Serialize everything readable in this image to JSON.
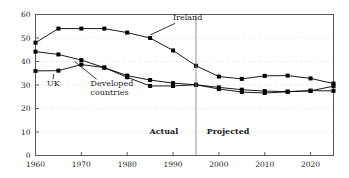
{
  "chart_data": {
    "type": "line",
    "title": "",
    "subtitle": "",
    "xlabel": "",
    "ylabel": "",
    "xlim": [
      1960,
      2025
    ],
    "ylim": [
      0,
      60
    ],
    "grid": true,
    "grid_style": "dotted-horizontal",
    "legend_position": "inline-annotations",
    "x_ticks": [
      1960,
      1970,
      1980,
      1990,
      2000,
      2010,
      2020
    ],
    "x_tick_labels": [
      "1960",
      "1970",
      "1980",
      "1990",
      "2000",
      "2010",
      "2020"
    ],
    "y_ticks": [
      0,
      10,
      20,
      30,
      40,
      50,
      60
    ],
    "y_tick_labels": [
      "0",
      "10",
      "20",
      "30",
      "40",
      "50",
      "60"
    ],
    "x": [
      1960,
      1965,
      1970,
      1975,
      1980,
      1985,
      1990,
      1995,
      2000,
      2005,
      2010,
      2015,
      2020,
      2025
    ],
    "series": [
      {
        "name": "Ireland",
        "marker": "square",
        "color": "#000000",
        "values": [
          48.0,
          54.0,
          54.0,
          54.0,
          52.3,
          50.0,
          44.7,
          38.2,
          33.6,
          32.6,
          33.9,
          34.0,
          32.8,
          30.6
        ]
      },
      {
        "name": "Developed countries",
        "marker": "square",
        "color": "#000000",
        "values": [
          44.2,
          43.0,
          40.6,
          37.4,
          34.0,
          32.1,
          30.8,
          30.1,
          28.3,
          27.0,
          26.6,
          27.1,
          27.6,
          27.5
        ]
      },
      {
        "name": "UK",
        "marker": "square",
        "color": "#000000",
        "values": [
          36.0,
          36.1,
          38.7,
          37.4,
          33.3,
          29.6,
          29.6,
          30.1,
          29.0,
          28.0,
          27.4,
          27.2,
          27.5,
          29.5
        ]
      }
    ],
    "annotations": [
      {
        "name": "ireland-label",
        "text": "Ireland",
        "x": 1990,
        "y": 57.5,
        "points_to": {
          "x": 1985,
          "y": 50.0
        }
      },
      {
        "name": "uk-label",
        "text": "UK",
        "x": 1962.5,
        "y": 29.5,
        "points_to": {
          "x": 1964,
          "y": 36.0
        }
      },
      {
        "name": "developed-countries-label",
        "text": "Developed",
        "text2": "countries",
        "x": 1972,
        "y": 29.5,
        "points_to": {
          "x": 1968.5,
          "y": 41.3
        }
      }
    ],
    "divider": {
      "name": "actual-projected-divider",
      "x": 1995
    },
    "phase_labels": [
      {
        "name": "actual-label",
        "text": "Actual",
        "x": 1988,
        "y": 9.0
      },
      {
        "name": "projected-label",
        "text": "Projected",
        "x": 2002,
        "y": 9.0
      }
    ],
    "colors": {
      "line": "#000000",
      "marker": "#000000",
      "grid": "#cfcfcf",
      "frame": "#5a5a5a",
      "text": "#1a1a1a",
      "background": "#ffffff"
    }
  }
}
